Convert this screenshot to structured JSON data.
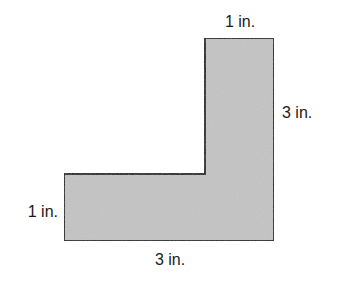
{
  "diagram": {
    "shape": "L-shape",
    "fill_color": "#c4c4c4",
    "stroke_color": "#1a1a1a",
    "labels": {
      "top": "1 in.",
      "right": "3 in.",
      "left": "1 in.",
      "bottom": "3 in."
    }
  }
}
